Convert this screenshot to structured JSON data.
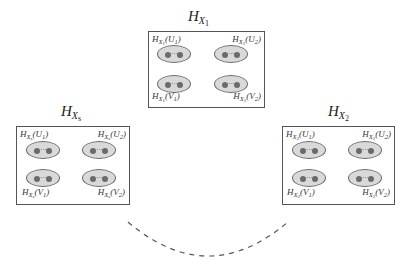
{
  "diagram": {
    "colors": {
      "box_border": "#555555",
      "ellipse_fill": "#d9d9d9",
      "ellipse_border": "#6a6a6a",
      "node_fill": "#6b6b6b",
      "arc": "#555555"
    },
    "clusters": [
      {
        "id": "x1",
        "title": {
          "base": "H",
          "sub": "X",
          "subsub": "1"
        },
        "labels": {
          "u1": {
            "base": "H",
            "sub": "X",
            "subsub": "1",
            "arg": "(U",
            "argsub": "1",
            "close": ")"
          },
          "u2": {
            "base": "H",
            "sub": "X",
            "subsub": "1",
            "arg": "(U",
            "argsub": "2",
            "close": ")"
          },
          "v1": {
            "base": "H",
            "sub": "X",
            "subsub": "1",
            "arg": "(V",
            "argsub": "1",
            "close": ")"
          },
          "v2": {
            "base": "H",
            "sub": "X",
            "subsub": "1",
            "arg": "(V",
            "argsub": "2",
            "close": ")"
          }
        }
      },
      {
        "id": "xs",
        "title": {
          "base": "H",
          "sub": "X",
          "subsub": "s"
        },
        "labels": {
          "u1": {
            "base": "H",
            "sub": "X",
            "subsub": "s",
            "arg": "(U",
            "argsub": "1",
            "close": ")"
          },
          "u2": {
            "base": "H",
            "sub": "X",
            "subsub": "s",
            "arg": "(U",
            "argsub": "2",
            "close": ")"
          },
          "v1": {
            "base": "H",
            "sub": "X",
            "subsub": "s",
            "arg": "(V",
            "argsub": "1",
            "close": ")"
          },
          "v2": {
            "base": "H",
            "sub": "X",
            "subsub": "s",
            "arg": "(V",
            "argsub": "2",
            "close": ")"
          }
        }
      },
      {
        "id": "x2",
        "title": {
          "base": "H",
          "sub": "X",
          "subsub": "2"
        },
        "labels": {
          "u1": {
            "base": "H",
            "sub": "X",
            "subsub": "2",
            "arg": "(U",
            "argsub": "1",
            "close": ")"
          },
          "u2": {
            "base": "H",
            "sub": "X",
            "subsub": "2",
            "arg": "(U",
            "argsub": "2",
            "close": ")"
          },
          "v1": {
            "base": "H",
            "sub": "X",
            "subsub": "2",
            "arg": "(V",
            "argsub": "1",
            "close": ")"
          },
          "v2": {
            "base": "H",
            "sub": "X",
            "subsub": "2",
            "arg": "(V",
            "argsub": "2",
            "close": ")"
          }
        }
      }
    ],
    "ellipse_dots": "···",
    "connector": "dashed-arc"
  }
}
